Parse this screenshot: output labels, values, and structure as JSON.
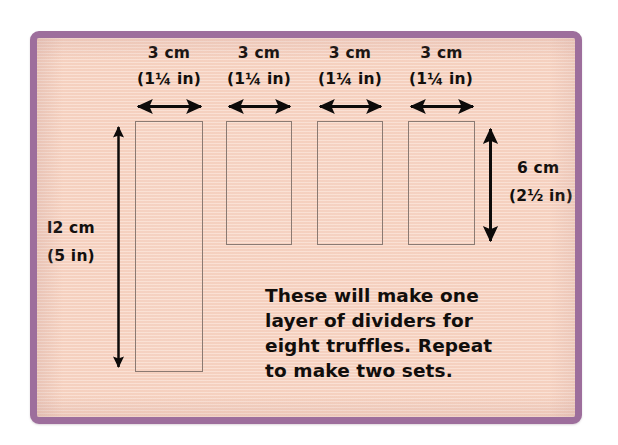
{
  "illustration": {
    "title_alt": "Truffle box divider cutting diagram",
    "mat": {
      "border_color": "#9d6e9c",
      "background_color": "#f8d6c5",
      "outline_color": "#8b7a72"
    },
    "top_dimensions": [
      {
        "metric": "3 cm",
        "imperial": "(1¼ in)"
      },
      {
        "metric": "3 cm",
        "imperial": "(1¼ in)"
      },
      {
        "metric": "3 cm",
        "imperial": "(1¼ in)"
      },
      {
        "metric": "3 cm",
        "imperial": "(1¼ in)"
      }
    ],
    "left_dimension": {
      "metric": "l2 cm",
      "imperial": "(5 in)"
    },
    "right_dimension": {
      "metric": "6 cm",
      "imperial": "(2½ in)"
    },
    "note_lines": [
      "These will make one",
      "layer of dividers for",
      "eight truffles. Repeat",
      "to make two sets."
    ],
    "strips": [
      {
        "label": "tall-strip",
        "width_cm": 3,
        "height_cm": 12
      },
      {
        "label": "short-strip",
        "width_cm": 3,
        "height_cm": 6
      },
      {
        "label": "short-strip",
        "width_cm": 3,
        "height_cm": 6
      },
      {
        "label": "short-strip",
        "width_cm": 3,
        "height_cm": 6
      }
    ]
  }
}
